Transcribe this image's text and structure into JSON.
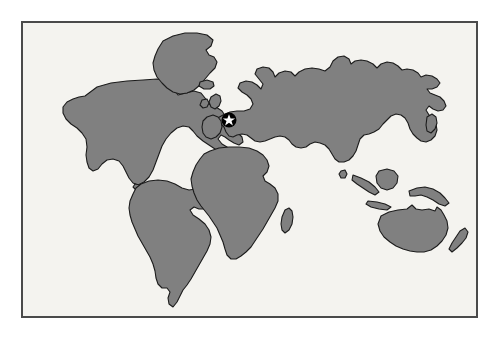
{
  "figure": {
    "type": "world-map",
    "frame": {
      "x": 21,
      "y": 21,
      "width": 457,
      "height": 297,
      "border_color": "#4a4a4a",
      "border_width": 2
    },
    "colors": {
      "page_background": "#ffffff",
      "ocean": "#f4f3ef",
      "land_fill": "#808080",
      "land_outline": "#1b1b1b",
      "marker_disc": "#000000",
      "marker_star": "#ffffff",
      "frame_border": "#4a4a4a"
    }
  },
  "marker": {
    "name": "location-marker",
    "shape": "star-in-circle",
    "region_label": "Western Europe",
    "center_x": 228,
    "center_y": 119,
    "radius": 7
  },
  "landmasses": [
    {
      "name": "north-america",
      "label": "North America"
    },
    {
      "name": "greenland",
      "label": "Greenland"
    },
    {
      "name": "iceland",
      "label": "Iceland"
    },
    {
      "name": "south-america",
      "label": "South America"
    },
    {
      "name": "africa",
      "label": "Africa"
    },
    {
      "name": "madagascar",
      "label": "Madagascar"
    },
    {
      "name": "eurasia",
      "label": "Eurasia"
    },
    {
      "name": "british-isles",
      "label": "British Isles"
    },
    {
      "name": "japan",
      "label": "Japan"
    },
    {
      "name": "indonesia",
      "label": "Indonesia"
    },
    {
      "name": "borneo",
      "label": "Borneo"
    },
    {
      "name": "new-guinea",
      "label": "New Guinea"
    },
    {
      "name": "australia",
      "label": "Australia"
    },
    {
      "name": "new-zealand",
      "label": "New Zealand"
    },
    {
      "name": "sri-lanka",
      "label": "Sri Lanka"
    }
  ]
}
